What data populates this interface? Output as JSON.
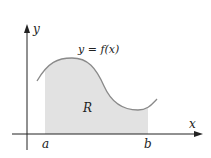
{
  "diagram": {
    "function_label": "y = f(x)",
    "region_label": "R",
    "x_axis_label": "x",
    "y_axis_label": "y",
    "lower_bound_label": "a",
    "upper_bound_label": "b",
    "colors": {
      "curve": "#8a8a8a",
      "region_fill": "#e2e2e2",
      "axis": "#222222"
    }
  }
}
